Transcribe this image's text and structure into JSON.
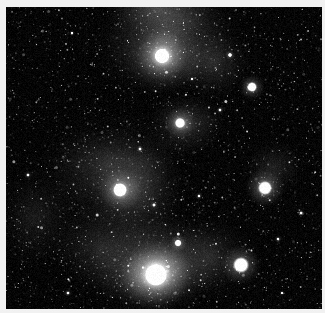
{
  "image": {
    "title": "Deep-sky astronomical photograph",
    "subject": "rho Ophiuchi style star-forming region with reflection nebulosity and dark dust lanes",
    "color_mode": "grayscale",
    "width": 325,
    "height": 313,
    "border_color": "#f1f1f1",
    "background_color": "#050505",
    "frame": {
      "x": 6,
      "y": 7,
      "width": 316,
      "height": 302
    }
  },
  "chart_data": {
    "type": "scatter",
    "xlabel": "",
    "ylabel": "",
    "xlim": [
      0,
      316
    ],
    "ylim": [
      0,
      302
    ],
    "grid": false,
    "legend": "none",
    "noise": {
      "star_field_count": 2600,
      "base_level": 10,
      "scanline_amplitude": 6
    },
    "nebulae": [
      {
        "name": "upper-central-reflection-glow",
        "x": 160,
        "y": 30,
        "rx": 78,
        "ry": 60,
        "intensity": 0.5,
        "rotation": -18
      },
      {
        "name": "top-edge-bright-streamer",
        "x": 152,
        "y": 2,
        "rx": 62,
        "ry": 34,
        "intensity": 0.44,
        "rotation": 12
      },
      {
        "name": "star-162-56-reflection-halo",
        "x": 160,
        "y": 52,
        "rx": 46,
        "ry": 38,
        "intensity": 0.52,
        "rotation": 0
      },
      {
        "name": "upper-right-wisp",
        "x": 208,
        "y": 56,
        "rx": 40,
        "ry": 40,
        "intensity": 0.33,
        "rotation": 20
      },
      {
        "name": "central-dust-glow",
        "x": 178,
        "y": 118,
        "rx": 44,
        "ry": 34,
        "intensity": 0.44,
        "rotation": -10
      },
      {
        "name": "mid-left-broad-nebulosity",
        "x": 100,
        "y": 160,
        "rx": 72,
        "ry": 66,
        "intensity": 0.34,
        "rotation": 25
      },
      {
        "name": "central-column-glow",
        "x": 130,
        "y": 180,
        "rx": 52,
        "ry": 72,
        "intensity": 0.4,
        "rotation": 0
      },
      {
        "name": "lower-central-bright-nebula",
        "x": 150,
        "y": 258,
        "rx": 78,
        "ry": 54,
        "intensity": 0.66,
        "rotation": -8
      },
      {
        "name": "lower-central-core-glow",
        "x": 150,
        "y": 268,
        "rx": 46,
        "ry": 30,
        "intensity": 0.72,
        "rotation": -8
      },
      {
        "name": "lower-left-faint-haze",
        "x": 96,
        "y": 240,
        "rx": 56,
        "ry": 48,
        "intensity": 0.3,
        "rotation": 15
      },
      {
        "name": "lower-right-haze",
        "x": 206,
        "y": 250,
        "rx": 46,
        "ry": 44,
        "intensity": 0.26,
        "rotation": 0
      },
      {
        "name": "right-star-arc-nebulosity",
        "x": 268,
        "y": 160,
        "rx": 34,
        "ry": 30,
        "intensity": 0.26,
        "rotation": -30
      },
      {
        "name": "left-edge-haze",
        "x": 30,
        "y": 210,
        "rx": 44,
        "ry": 54,
        "intensity": 0.2,
        "rotation": 0
      }
    ],
    "dark_lanes": [
      {
        "name": "main-dust-lane-left",
        "x": 60,
        "y": 120,
        "rx": 82,
        "ry": 34,
        "intensity": 0.62,
        "rotation": -14
      },
      {
        "name": "dust-lane-center",
        "x": 140,
        "y": 128,
        "rx": 58,
        "ry": 24,
        "intensity": 0.5,
        "rotation": -6
      },
      {
        "name": "dust-lane-upper-left",
        "x": 48,
        "y": 72,
        "rx": 60,
        "ry": 40,
        "intensity": 0.46,
        "rotation": 10
      },
      {
        "name": "dark-right-field",
        "x": 286,
        "y": 90,
        "rx": 56,
        "ry": 80,
        "intensity": 0.45,
        "rotation": 0
      },
      {
        "name": "dark-lower-left-corner",
        "x": 18,
        "y": 288,
        "rx": 48,
        "ry": 40,
        "intensity": 0.4,
        "rotation": 0
      },
      {
        "name": "dark-notch-mid-left",
        "x": 96,
        "y": 112,
        "rx": 30,
        "ry": 18,
        "intensity": 0.55,
        "rotation": 0
      }
    ],
    "bright_stars": [
      {
        "name": "star-top-center",
        "label": "S1",
        "x": 156,
        "y": 49,
        "radius": 7.5,
        "brightness": 1.0,
        "glow": 26
      },
      {
        "name": "star-upper-right",
        "label": "S2",
        "x": 246,
        "y": 80,
        "radius": 5.0,
        "brightness": 0.95,
        "glow": 13
      },
      {
        "name": "star-center",
        "label": "S3",
        "x": 174,
        "y": 116,
        "radius": 5.2,
        "brightness": 0.92,
        "glow": 16
      },
      {
        "name": "star-mid-left",
        "label": "S4",
        "x": 114,
        "y": 183,
        "radius": 7.0,
        "brightness": 1.0,
        "glow": 22
      },
      {
        "name": "star-right",
        "label": "S5",
        "x": 259,
        "y": 181,
        "radius": 7.0,
        "brightness": 1.0,
        "glow": 20
      },
      {
        "name": "star-bottom-center-brightest",
        "label": "S6",
        "x": 150,
        "y": 268,
        "radius": 11.0,
        "brightness": 1.0,
        "glow": 36
      },
      {
        "name": "star-bottom-right",
        "label": "S7",
        "x": 235,
        "y": 258,
        "radius": 8.0,
        "brightness": 1.0,
        "glow": 20
      },
      {
        "name": "star-lower-center-small",
        "label": "S8",
        "x": 172,
        "y": 236,
        "radius": 3.6,
        "brightness": 0.9,
        "glow": 9
      },
      {
        "name": "star-upper-far-right",
        "label": "S9",
        "x": 224,
        "y": 48,
        "radius": 2.2,
        "brightness": 0.8,
        "glow": 5
      },
      {
        "name": "star-right-upper-faint",
        "label": "S10",
        "x": 214,
        "y": 103,
        "radius": 1.8,
        "brightness": 0.7,
        "glow": 4
      },
      {
        "name": "star-mid-center-faint",
        "label": "S11",
        "x": 134,
        "y": 142,
        "radius": 1.8,
        "brightness": 0.68,
        "glow": 4
      },
      {
        "name": "star-center-low-faint",
        "label": "S12",
        "x": 148,
        "y": 198,
        "radius": 1.9,
        "brightness": 0.72,
        "glow": 4
      },
      {
        "name": "star-right-mid-faint",
        "label": "S13",
        "x": 193,
        "y": 189,
        "radius": 1.7,
        "brightness": 0.65,
        "glow": 4
      },
      {
        "name": "star-far-right-low",
        "label": "S14",
        "x": 295,
        "y": 206,
        "radius": 1.8,
        "brightness": 0.68,
        "glow": 4
      },
      {
        "name": "star-left-edge",
        "label": "S15",
        "x": 22,
        "y": 168,
        "radius": 1.8,
        "brightness": 0.66,
        "glow": 4
      },
      {
        "name": "star-top-left-faint",
        "label": "S16",
        "x": 66,
        "y": 26,
        "radius": 1.6,
        "brightness": 0.62,
        "glow": 3
      },
      {
        "name": "star-bottom-left-faint",
        "label": "S17",
        "x": 62,
        "y": 286,
        "radius": 1.8,
        "brightness": 0.66,
        "glow": 4
      },
      {
        "name": "star-right-bottom-faint",
        "label": "S18",
        "x": 276,
        "y": 286,
        "radius": 1.6,
        "brightness": 0.6,
        "glow": 3
      },
      {
        "name": "star-upper-mid-faint",
        "label": "S19",
        "x": 186,
        "y": 72,
        "radius": 1.6,
        "brightness": 0.62,
        "glow": 3
      },
      {
        "name": "star-right-of-core",
        "label": "S20",
        "x": 272,
        "y": 232,
        "radius": 1.7,
        "brightness": 0.64,
        "glow": 4
      }
    ]
  }
}
